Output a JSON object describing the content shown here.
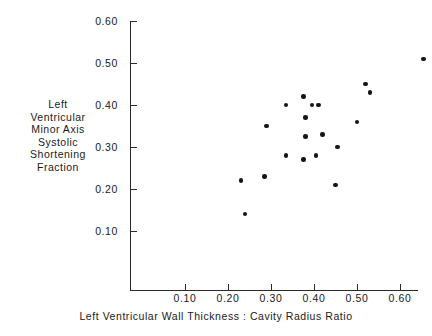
{
  "chart_data": {
    "type": "scatter",
    "title": "",
    "xlabel": "Left Ventricular Wall Thickness : Cavity Radius Ratio",
    "ylabel_lines": [
      "Left",
      "Ventricular",
      "Minor Axis",
      "Systolic",
      "Shortening",
      "Fraction"
    ],
    "ylabel": "Left Ventricular Minor Axis Systolic Shortening Fraction",
    "xlim": [
      0.0,
      0.67
    ],
    "ylim": [
      0.0,
      0.6
    ],
    "grid": false,
    "legend": null,
    "xticks": [
      0.1,
      0.2,
      0.3,
      0.4,
      0.5,
      0.6
    ],
    "yticks": [
      0.1,
      0.2,
      0.3,
      0.4,
      0.5,
      0.6
    ],
    "xticklabels": [
      "0.10",
      "0.20",
      "0.30",
      "0.40",
      "0.50",
      "0.60"
    ],
    "yticklabels": [
      "0.60",
      "0.50",
      "0.40",
      "0.30",
      "0.20",
      "0.10"
    ],
    "marker": "filled-circle",
    "marker_color": "#151515",
    "axis_color": "#2a2a2a",
    "points": [
      {
        "x": 0.23,
        "y": 0.22
      },
      {
        "x": 0.24,
        "y": 0.14
      },
      {
        "x": 0.285,
        "y": 0.23
      },
      {
        "x": 0.29,
        "y": 0.35
      },
      {
        "x": 0.335,
        "y": 0.28
      },
      {
        "x": 0.335,
        "y": 0.4
      },
      {
        "x": 0.375,
        "y": 0.27
      },
      {
        "x": 0.375,
        "y": 0.42
      },
      {
        "x": 0.38,
        "y": 0.325
      },
      {
        "x": 0.38,
        "y": 0.37
      },
      {
        "x": 0.395,
        "y": 0.4
      },
      {
        "x": 0.405,
        "y": 0.28
      },
      {
        "x": 0.41,
        "y": 0.4
      },
      {
        "x": 0.42,
        "y": 0.33
      },
      {
        "x": 0.45,
        "y": 0.21
      },
      {
        "x": 0.455,
        "y": 0.3
      },
      {
        "x": 0.5,
        "y": 0.36
      },
      {
        "x": 0.52,
        "y": 0.45
      },
      {
        "x": 0.53,
        "y": 0.43
      },
      {
        "x": 0.655,
        "y": 0.51
      }
    ],
    "n_points": 20
  }
}
